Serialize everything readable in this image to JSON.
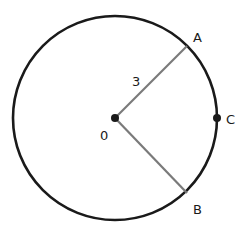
{
  "diagram": {
    "type": "circle-geometry",
    "circle": {
      "cx": 115,
      "cy": 118,
      "r": 102,
      "stroke": "#1a1a1a"
    },
    "center": {
      "label": "0",
      "x": 115,
      "y": 118
    },
    "points": {
      "A": {
        "label": "A",
        "x": 187,
        "y": 46
      },
      "B": {
        "label": "B",
        "x": 187,
        "y": 193
      },
      "C": {
        "label": "C",
        "x": 217,
        "y": 118
      }
    },
    "radii": [
      {
        "from": "0",
        "to": "A",
        "color": "#7a7a7a"
      },
      {
        "from": "0",
        "to": "B",
        "color": "#7a7a7a"
      }
    ],
    "radius_label": "3"
  }
}
